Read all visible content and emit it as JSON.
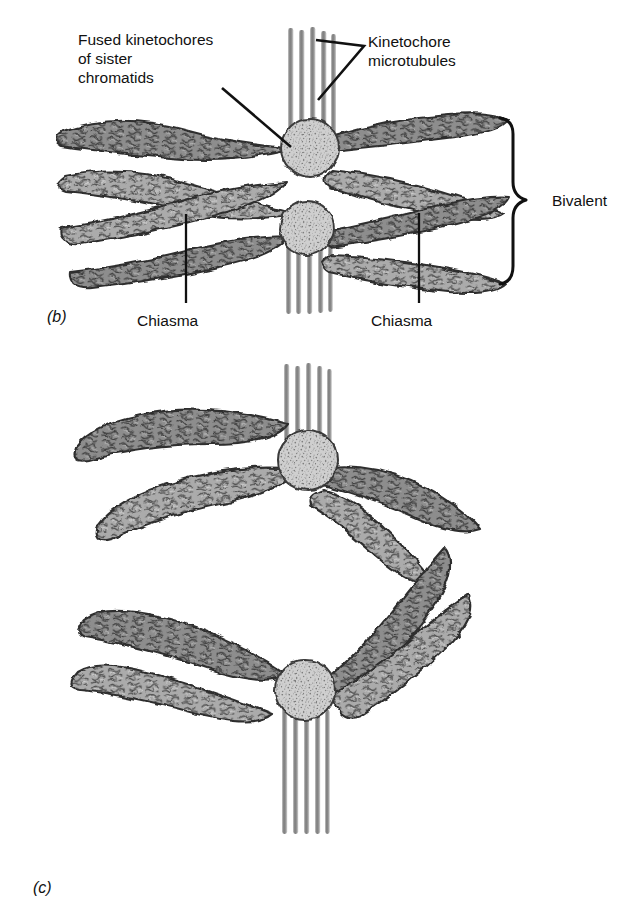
{
  "figure": {
    "title_absent": true,
    "background_color": "#ffffff",
    "ink_color": "#111111",
    "chromatin_dark": "#8a8a8a",
    "chromatin_light": "#aaaaaa",
    "kinetochore_fill": "#c9c9c9",
    "microtubule_color": "#9a9a9a",
    "outline_color": "#2b2b2b"
  },
  "labels": {
    "fused_kinetochores": "Fused kinetochores\nof sister\nchromatids",
    "kinetochore_microtubules": "Kinetochore\nmicrotubules",
    "bivalent": "Bivalent",
    "chiasma_left": "Chiasma",
    "chiasma_right": "Chiasma"
  },
  "panels": [
    {
      "id": "b",
      "label": "(b)",
      "caption_absent": true
    },
    {
      "id": "c",
      "label": "(c)",
      "caption_absent": true
    }
  ],
  "structures": {
    "panel_b": {
      "kinetochores": [
        {
          "name": "upper-kinetochore",
          "cx": 310,
          "cy": 148,
          "r": 29
        },
        {
          "name": "lower-kinetochore",
          "cx": 307,
          "cy": 228,
          "r": 27
        }
      ],
      "microtubule_bundles": [
        {
          "name": "upper-bundle",
          "fibers": 5,
          "x_start": 288,
          "x_end": 334,
          "y_top": 28,
          "y_bottom": 125
        },
        {
          "name": "lower-bundle",
          "fibers": 5,
          "x_start": 286,
          "x_end": 332,
          "y_top": 250,
          "y_bottom": 312
        }
      ],
      "chromatid_arms": 8,
      "chiasmata": 2,
      "bracket": {
        "name": "bivalent-bracket",
        "x": 500,
        "y_top": 118,
        "y_bottom": 288
      }
    },
    "panel_c": {
      "kinetochores": [
        {
          "name": "upper-kinetochore",
          "cx": 308,
          "cy": 460,
          "r": 30
        },
        {
          "name": "lower-kinetochore",
          "cx": 305,
          "cy": 690,
          "r": 30
        }
      ],
      "microtubule_bundles": [
        {
          "name": "upper-bundle",
          "fibers": 5,
          "x_start": 284,
          "x_end": 330,
          "y_top": 364,
          "y_bottom": 438
        },
        {
          "name": "lower-bundle",
          "fibers": 5,
          "x_start": 282,
          "x_end": 330,
          "y_top": 712,
          "y_bottom": 834
        }
      ],
      "chromatid_arms": 8,
      "chiasmata": 0
    }
  },
  "leader_lines": [
    {
      "name": "leader-fused-kinetochores",
      "from": [
        222,
        88
      ],
      "to": [
        289,
        146
      ]
    },
    {
      "name": "leader-kmt-upper",
      "from": [
        362,
        52
      ],
      "to": [
        311,
        40
      ]
    },
    {
      "name": "leader-kmt-lower",
      "from": [
        362,
        56
      ],
      "to": [
        314,
        96
      ]
    },
    {
      "name": "leader-chiasma-left",
      "from": [
        186,
        300
      ],
      "to": [
        186,
        216
      ]
    },
    {
      "name": "leader-chiasma-right",
      "from": [
        419,
        300
      ],
      "to": [
        419,
        215
      ]
    }
  ]
}
